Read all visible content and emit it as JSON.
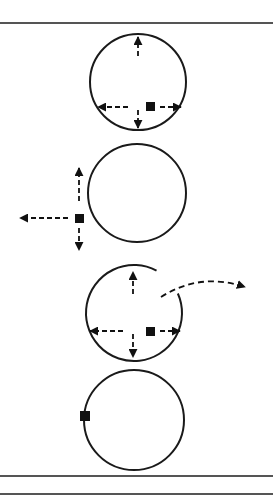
{
  "colors": {
    "stroke": "#1a1a1a",
    "fill": "#111111",
    "rule": "#555555",
    "background": "#ffffff"
  },
  "rules": [
    {
      "name": "top-rule",
      "y": 22
    },
    {
      "name": "bottom-rule-1",
      "y": 475
    },
    {
      "name": "bottom-rule-2",
      "y": 493
    }
  ],
  "panels": [
    {
      "name": "panel-1",
      "circle": {
        "cx": 138,
        "cy": 82,
        "r": 48
      },
      "square": {
        "x": 146,
        "y": 102,
        "size": 9
      },
      "arrows": [
        {
          "dir": "up",
          "from": [
            138,
            56
          ],
          "to": [
            138,
            37
          ]
        },
        {
          "dir": "left",
          "from": [
            128,
            107
          ],
          "to": [
            98,
            107
          ]
        },
        {
          "dir": "right",
          "from": [
            160,
            107
          ],
          "to": [
            181,
            107
          ]
        },
        {
          "dir": "down",
          "from": [
            138,
            110
          ],
          "to": [
            138,
            128
          ]
        }
      ]
    },
    {
      "name": "panel-2",
      "circle": {
        "cx": 137,
        "cy": 193,
        "r": 49
      },
      "square": {
        "x": 75,
        "y": 214,
        "size": 9
      },
      "arrows": [
        {
          "dir": "up",
          "from": [
            79,
            201
          ],
          "to": [
            79,
            168
          ]
        },
        {
          "dir": "left",
          "from": [
            68,
            218
          ],
          "to": [
            20,
            218
          ]
        },
        {
          "dir": "down",
          "from": [
            79,
            228
          ],
          "to": [
            79,
            250
          ]
        }
      ]
    },
    {
      "name": "panel-3",
      "circle": {
        "cx": 134,
        "cy": 313,
        "r": 48,
        "gap_start_deg": -62,
        "gap_end_deg": -24
      },
      "square": {
        "x": 146,
        "y": 327,
        "size": 9
      },
      "arrows": [
        {
          "dir": "up",
          "from": [
            133,
            294
          ],
          "to": [
            133,
            272
          ]
        },
        {
          "dir": "left",
          "from": [
            123,
            331
          ],
          "to": [
            90,
            331
          ]
        },
        {
          "dir": "right",
          "from": [
            160,
            331
          ],
          "to": [
            180,
            331
          ]
        },
        {
          "dir": "down",
          "from": [
            133,
            334
          ],
          "to": [
            133,
            357
          ]
        }
      ],
      "escape_arrow": {
        "from": [
          161,
          297
        ],
        "control": [
          200,
          272
        ],
        "to": [
          245,
          287
        ]
      }
    },
    {
      "name": "panel-4",
      "circle": {
        "cx": 134,
        "cy": 420,
        "r": 50
      },
      "square": {
        "x": 80,
        "y": 411,
        "size": 10
      },
      "arrows": []
    }
  ]
}
